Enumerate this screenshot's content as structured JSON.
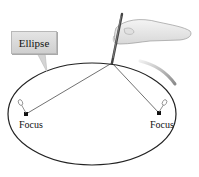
{
  "figure": {
    "callout_label": "Ellipse",
    "foci": [
      {
        "label": "Focus",
        "x": 26,
        "y": 114
      },
      {
        "label": "Focus",
        "x": 159,
        "y": 113
      }
    ],
    "pen_point": {
      "x": 112,
      "y": 63
    },
    "ellipse": {
      "cx": 92,
      "cy": 114,
      "rx": 84,
      "ry": 51
    },
    "colors": {
      "stroke": "#222222",
      "string": "#333333",
      "label_bg": "#d8d8d8",
      "arrow": "#9a9a9a",
      "hand": "#e8e8e8"
    }
  }
}
